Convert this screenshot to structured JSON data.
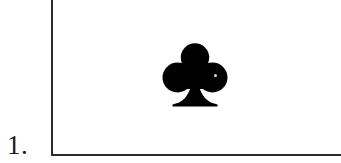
{
  "figure": {
    "item_number": "1.",
    "background_color": "#ffffff",
    "rule_color": "#2b2b2b",
    "ink_color": "#000000"
  },
  "rules": {
    "vertical_rule_name": "left vertical rule",
    "horizontal_rule_name": "bottom horizontal rule"
  },
  "suit": {
    "symbol": "♣",
    "name": "club",
    "color": "#000000"
  }
}
